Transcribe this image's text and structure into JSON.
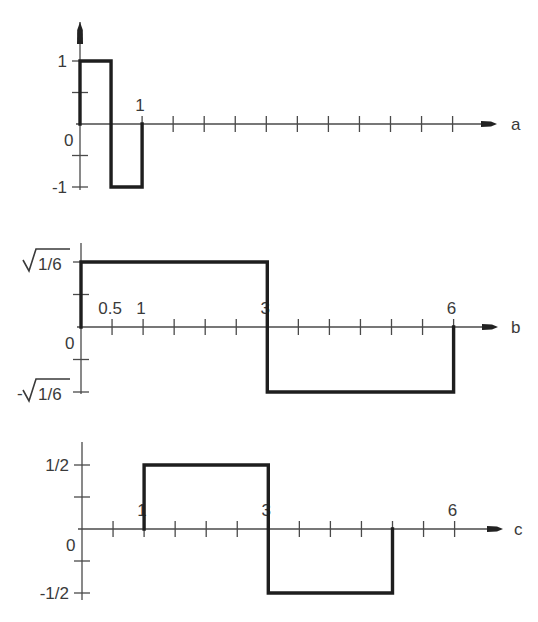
{
  "chart_data": {
    "type": "line",
    "step": true,
    "panels": [
      {
        "label": "a",
        "x_range": [
          0,
          6
        ],
        "tick_step": 0.5,
        "y_scale_max": 1,
        "y_labels": [
          {
            "value": 1,
            "text": "1"
          },
          {
            "value": 0,
            "text": "0"
          },
          {
            "value": -1,
            "text": "-1"
          }
        ],
        "x_labels": [
          {
            "value": 1,
            "text": "1"
          }
        ],
        "vertical_arrow": true,
        "segments": [
          {
            "x0": 0,
            "x1": 0.5,
            "y": 1
          },
          {
            "x0": 0.5,
            "x1": 1,
            "y": -1
          }
        ]
      },
      {
        "label": "b",
        "x_range": [
          0,
          6
        ],
        "tick_step": 0.5,
        "y_scale_max": 1,
        "y_labels": [
          {
            "value": 1,
            "text": "1/6",
            "sqrt": true,
            "sign": ""
          },
          {
            "value": 0,
            "text": "0"
          },
          {
            "value": -1,
            "text": "1/6",
            "sqrt": true,
            "sign": "-"
          }
        ],
        "y_value_note": "levels are ±sqrt(1/6)",
        "x_labels": [
          {
            "value": 0.5,
            "text": "0.5"
          },
          {
            "value": 1,
            "text": "1"
          },
          {
            "value": 3,
            "text": "3"
          },
          {
            "value": 6,
            "text": "6"
          }
        ],
        "vertical_arrow": false,
        "segments": [
          {
            "x0": 0,
            "x1": 3,
            "y": 1
          },
          {
            "x0": 3,
            "x1": 6,
            "y": -1
          }
        ]
      },
      {
        "label": "c",
        "x_range": [
          0,
          6
        ],
        "tick_step": 0.5,
        "y_scale_max": 1,
        "y_labels": [
          {
            "value": 1,
            "text": "1/2"
          },
          {
            "value": 0,
            "text": "0"
          },
          {
            "value": -1,
            "text": "-1/2"
          }
        ],
        "y_value_note": "levels are ±1/2",
        "x_labels": [
          {
            "value": 1,
            "text": "1"
          },
          {
            "value": 3,
            "text": "3"
          },
          {
            "value": 6,
            "text": "6"
          }
        ],
        "vertical_arrow": false,
        "segments": [
          {
            "x0": 1,
            "x1": 3,
            "y": 1
          },
          {
            "x0": 3,
            "x1": 5,
            "y": -1
          }
        ]
      }
    ]
  }
}
